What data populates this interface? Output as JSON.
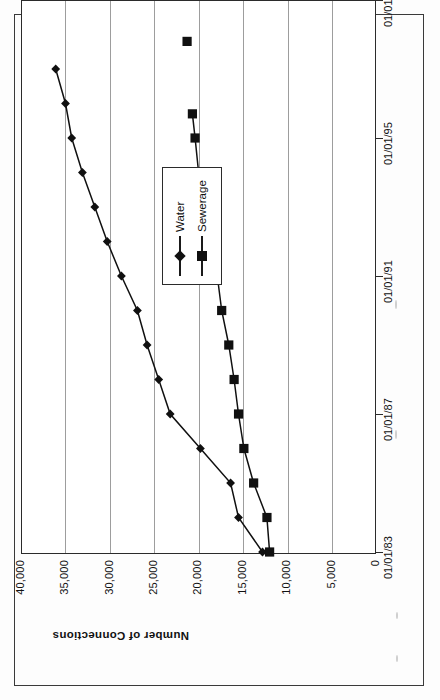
{
  "figure": {
    "orientation": "rotated-90-ccw",
    "ink_color": "#101010"
  },
  "chart_data": {
    "type": "line",
    "title": "",
    "xlabel": "",
    "ylabel": "Number of Connections",
    "x_tick_labels": [
      "01/01/83",
      "01/01/87",
      "01/01/91",
      "01/01/95",
      "01/01/99"
    ],
    "y_tick_labels": [
      "0",
      "5,000",
      "10,000",
      "15,000",
      "20,000",
      "25,000",
      "30,000",
      "35,000",
      "40,000"
    ],
    "ylim": [
      0,
      40000
    ],
    "xlim": [
      "01/01/83",
      "01/01/99"
    ],
    "grid": "y-gridlines-only",
    "legend_position": "middle-right",
    "series": [
      {
        "name": "Water",
        "marker": "diamond",
        "points": [
          {
            "date": "01/01/83",
            "value": 12900
          },
          {
            "date": "01/01/84",
            "value": 15600
          },
          {
            "date": "01/01/85",
            "value": 16500
          },
          {
            "date": "01/01/86",
            "value": 19900
          },
          {
            "date": "01/01/87",
            "value": 23300
          },
          {
            "date": "01/01/88",
            "value": 24600
          },
          {
            "date": "01/01/89",
            "value": 25900
          },
          {
            "date": "01/01/90",
            "value": 27000
          },
          {
            "date": "01/01/91",
            "value": 28800
          },
          {
            "date": "01/01/92",
            "value": 30400
          },
          {
            "date": "01/01/93",
            "value": 31800
          },
          {
            "date": "01/01/94",
            "value": 33200
          },
          {
            "date": "01/01/95",
            "value": 34400
          },
          {
            "date": "01/01/96",
            "value": 35100
          },
          {
            "date": "01/01/97",
            "value": 36200
          }
        ]
      },
      {
        "name": "Sewerage",
        "marker": "square",
        "points": [
          {
            "date": "01/01/83",
            "value": 12100
          },
          {
            "date": "01/01/84",
            "value": 12400
          },
          {
            "date": "01/01/85",
            "value": 13900
          },
          {
            "date": "01/01/86",
            "value": 15000
          },
          {
            "date": "01/01/87",
            "value": 15600
          },
          {
            "date": "01/01/88",
            "value": 16100
          },
          {
            "date": "01/01/89",
            "value": 16700
          },
          {
            "date": "01/01/90",
            "value": 17500
          },
          {
            "date": "01/01/91",
            "value": 18000
          },
          {
            "date": "01/01/92",
            "value": 18600
          },
          {
            "date": "01/01/93",
            "value": 19300
          },
          {
            "date": "01/01/94",
            "value": 20100
          },
          {
            "date": "01/01/95",
            "value": 20500
          },
          {
            "date": "01/01/95.7",
            "value": 20800
          },
          {
            "date": "01/01/97.8",
            "value": 21400
          }
        ]
      }
    ]
  },
  "legend": {
    "items": [
      {
        "label": "Water",
        "marker": "diamond"
      },
      {
        "label": "Sewerage",
        "marker": "square"
      }
    ]
  }
}
